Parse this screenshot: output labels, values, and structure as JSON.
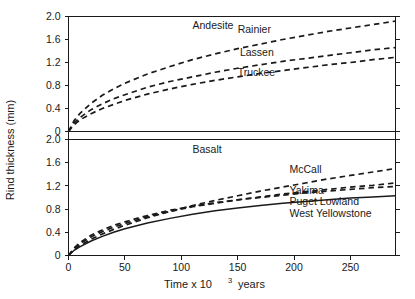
{
  "chart_data": {
    "type": "line",
    "title": "",
    "xlabel": "Time x 10³ years",
    "ylabel": "Rind thickness (mm)",
    "xlabel_base": "Time x 10",
    "xlabel_exp": "3",
    "xlabel_tail": "years",
    "xlim": [
      0,
      290
    ],
    "ylim": [
      0,
      2.0
    ],
    "grid": false,
    "legend": "inline-curve-labels",
    "xticks": [
      0,
      50,
      100,
      150,
      200,
      250
    ],
    "xtick_labels": [
      "0",
      "50",
      "100",
      "150",
      "200",
      "250"
    ],
    "yticks": [
      0,
      0.4,
      0.8,
      1.2,
      1.6,
      2.0
    ],
    "ytick_labels": [
      "0",
      "0.4",
      "0.8",
      "1.2",
      "1.6",
      "2.0"
    ],
    "panels": [
      {
        "name": "Andesite",
        "label": "Andesite",
        "label_x": 110,
        "label_y": 1.85,
        "series": [
          {
            "name": "Rainier",
            "style": "dashed",
            "label": "Rainier",
            "label_x": 150,
            "label_y": 1.78,
            "x": [
              0,
              5,
              10,
              20,
              30,
              40,
              50,
              70,
              90,
              110,
              130,
              150,
              170,
              190,
              210,
              230,
              250,
              270,
              290
            ],
            "y": [
              0,
              0.19,
              0.31,
              0.49,
              0.63,
              0.74,
              0.84,
              1.0,
              1.13,
              1.25,
              1.35,
              1.44,
              1.52,
              1.6,
              1.67,
              1.74,
              1.8,
              1.86,
              1.92
            ]
          },
          {
            "name": "Lassen",
            "style": "dashed",
            "label": "Lassen",
            "label_x": 152,
            "label_y": 1.37,
            "x": [
              0,
              5,
              10,
              20,
              30,
              40,
              50,
              70,
              90,
              110,
              130,
              150,
              170,
              190,
              210,
              230,
              250,
              270,
              290
            ],
            "y": [
              0,
              0.15,
              0.24,
              0.38,
              0.48,
              0.57,
              0.64,
              0.77,
              0.87,
              0.95,
              1.03,
              1.1,
              1.16,
              1.22,
              1.27,
              1.32,
              1.37,
              1.42,
              1.46
            ]
          },
          {
            "name": "Truckee",
            "style": "dashed",
            "label": "Truckee",
            "label_x": 150,
            "label_y": 1.02,
            "x": [
              0,
              5,
              10,
              20,
              30,
              40,
              50,
              70,
              90,
              110,
              130,
              150,
              170,
              190,
              210,
              230,
              250,
              270,
              290
            ],
            "y": [
              0,
              0.12,
              0.2,
              0.31,
              0.4,
              0.47,
              0.54,
              0.65,
              0.74,
              0.82,
              0.89,
              0.95,
              1.01,
              1.06,
              1.11,
              1.16,
              1.2,
              1.25,
              1.29
            ]
          }
        ]
      },
      {
        "name": "Basalt",
        "label": "Basalt",
        "label_x": 110,
        "label_y": 1.83,
        "series": [
          {
            "name": "McCall",
            "style": "dashed",
            "label": "McCall",
            "label_x": 196,
            "label_y": 1.48,
            "x": [
              0,
              5,
              10,
              20,
              30,
              40,
              50,
              70,
              90,
              110,
              130,
              150,
              170,
              190,
              210,
              230,
              250,
              270,
              290
            ],
            "y": [
              0,
              0.1,
              0.17,
              0.28,
              0.37,
              0.45,
              0.52,
              0.65,
              0.76,
              0.86,
              0.95,
              1.03,
              1.11,
              1.18,
              1.25,
              1.32,
              1.38,
              1.44,
              1.5
            ]
          },
          {
            "name": "Yakima",
            "style": "dashed",
            "label": "Yakima",
            "label_x": 196,
            "label_y": 1.12,
            "x": [
              0,
              5,
              10,
              20,
              30,
              40,
              50,
              70,
              90,
              110,
              130,
              150,
              170,
              190,
              210,
              230,
              250,
              270,
              290
            ],
            "y": [
              0,
              0.12,
              0.2,
              0.32,
              0.41,
              0.49,
              0.55,
              0.67,
              0.76,
              0.84,
              0.9,
              0.96,
              1.01,
              1.06,
              1.1,
              1.14,
              1.18,
              1.21,
              1.25
            ]
          },
          {
            "name": "Puget Lowland",
            "style": "dashed",
            "label": "Puget Lowland",
            "label_x": 196,
            "label_y": 0.93,
            "x": [
              0,
              5,
              10,
              20,
              30,
              40,
              50,
              70,
              90,
              110,
              130,
              150,
              170,
              190,
              210,
              230,
              250,
              270,
              290
            ],
            "y": [
              0,
              0.13,
              0.22,
              0.35,
              0.44,
              0.52,
              0.58,
              0.69,
              0.78,
              0.85,
              0.91,
              0.96,
              1.0,
              1.04,
              1.08,
              1.11,
              1.14,
              1.17,
              1.19
            ]
          },
          {
            "name": "West Yellowstone",
            "style": "solid",
            "label": "West Yellowstone",
            "label_x": 196,
            "label_y": 0.72,
            "x": [
              0,
              5,
              10,
              20,
              30,
              40,
              50,
              70,
              90,
              110,
              130,
              150,
              170,
              190,
              210,
              230,
              250,
              270,
              290
            ],
            "y": [
              0,
              0.09,
              0.15,
              0.25,
              0.33,
              0.4,
              0.46,
              0.56,
              0.64,
              0.71,
              0.77,
              0.82,
              0.86,
              0.9,
              0.93,
              0.96,
              0.99,
              1.01,
              1.03
            ]
          }
        ]
      }
    ]
  },
  "colors": {
    "axis": "#1a1a1a",
    "curve": "#1a1a1a",
    "background": "#ffffff"
  }
}
